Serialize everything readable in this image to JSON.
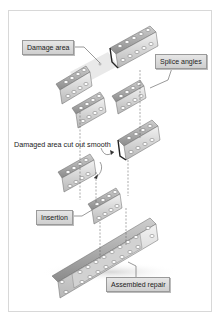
{
  "diagram": {
    "type": "exploded assembly / repair procedure",
    "labels": {
      "damage_area": "Damage area",
      "splice_angles": "Splice angles",
      "damaged_cut": "Damaged area cut out smooth",
      "insertion": "Insertion",
      "assembled_repair": "Assembled repair"
    },
    "colors": {
      "metal_light": "#e8e8e8",
      "metal_mid": "#c4c4c4",
      "metal_dark": "#8e8e8e",
      "label_bg": "#d9d9d9",
      "frame_border": "#d8d8d8"
    }
  }
}
